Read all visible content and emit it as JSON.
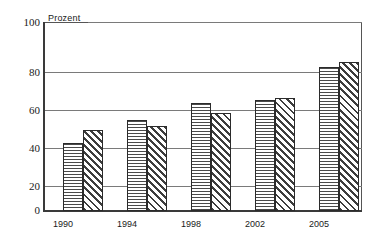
{
  "chart_data": {
    "type": "bar",
    "title": "",
    "subtitle": "",
    "xlabel": "",
    "ylabel": "Prozent",
    "categories": [
      "1990",
      "1994",
      "1998",
      "2002",
      "2005"
    ],
    "series": [
      {
        "name": "Reihe 1",
        "pattern": "horizontal-lines",
        "values": [
          36,
          48,
          57,
          59,
          76
        ]
      },
      {
        "name": "Reihe 2",
        "pattern": "diagonal-hatch",
        "values": [
          43,
          45,
          52,
          60,
          79
        ]
      }
    ],
    "ylim": [
      0,
      100
    ],
    "yticks": [
      0,
      20,
      40,
      60,
      80,
      100
    ],
    "ytick_labels": [
      "0",
      "20",
      "40",
      "60",
      "80",
      "100"
    ],
    "grid": true,
    "grid_axis": "y",
    "legend": false,
    "legend_position": "none",
    "annotations": []
  },
  "axis": {
    "y_title": "Prozent",
    "y_labels": [
      "100",
      "80",
      "60",
      "40",
      "20",
      "0"
    ],
    "x_labels": [
      "1990",
      "1994",
      "1998",
      "2002",
      "2005"
    ]
  },
  "colors": {
    "frame": "#555555",
    "gridline": "#7a7a7a",
    "axis": "#3a3a3a",
    "bar_outline": "#2b2b2b",
    "hatch": "#3d3d3d",
    "background": "#ffffff",
    "text": "#1a1a1a"
  }
}
